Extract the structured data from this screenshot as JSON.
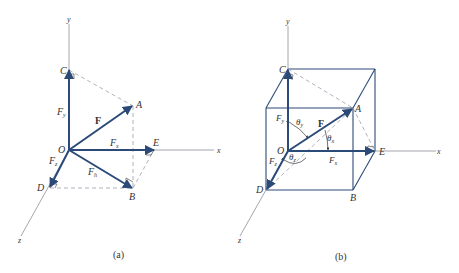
{
  "colors": {
    "vector": "#2c4a78",
    "axis": "#8a8f99",
    "dashed": "#9aa0aa",
    "text": "#333333"
  },
  "figure_a": {
    "caption": "(a)",
    "axes": {
      "x": "x",
      "y": "y",
      "z": "z"
    },
    "points": {
      "O": "O",
      "A": "A",
      "B": "B",
      "C": "C",
      "D": "D",
      "E": "E"
    },
    "vectors": {
      "F": "F",
      "Fx": "F",
      "Fx_sub": "x",
      "Fy": "F",
      "Fy_sub": "y",
      "Fz": "F",
      "Fz_sub": "z",
      "Fh": "F",
      "Fh_sub": "h"
    }
  },
  "figure_b": {
    "caption": "(b)",
    "axes": {
      "x": "x",
      "y": "y",
      "z": "z"
    },
    "points": {
      "O": "O",
      "A": "A",
      "B": "B",
      "C": "C",
      "D": "D",
      "E": "E"
    },
    "vectors": {
      "F": "F",
      "Fx": "F",
      "Fx_sub": "x",
      "Fy": "F",
      "Fy_sub": "y",
      "Fz": "F",
      "Fz_sub": "z"
    },
    "angles": {
      "theta_x": "θ",
      "theta_x_sub": "x",
      "theta_y": "θ",
      "theta_y_sub": "y",
      "theta_z": "θ",
      "theta_z_sub": "z"
    }
  }
}
